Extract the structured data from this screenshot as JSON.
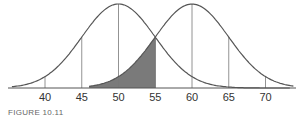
{
  "chart_data": {
    "type": "line",
    "title": "",
    "xlabel": "",
    "ylabel": "",
    "x_ticks": [
      40,
      45,
      50,
      55,
      60,
      65,
      70
    ],
    "xlim": [
      35.5,
      74
    ],
    "grid": false,
    "legend": null,
    "series": [
      {
        "name": "Distribution A",
        "kind": "normal",
        "mean": 50,
        "sd": 5
      },
      {
        "name": "Distribution B",
        "kind": "normal",
        "mean": 60,
        "sd": 5
      }
    ],
    "reference_lines": {
      "distribution_a": [
        40,
        45,
        50,
        55
      ],
      "distribution_b": [
        55,
        60,
        65,
        70
      ]
    },
    "shaded_region": {
      "under": "Distribution B",
      "from": 46,
      "to": 55,
      "color": "#7a7a7a"
    },
    "caption": "FIGURE 10.11"
  },
  "figure": {
    "caption": "FIGURE 10.11",
    "tick_labels": [
      "40",
      "45",
      "50",
      "55",
      "60",
      "65",
      "70"
    ]
  }
}
